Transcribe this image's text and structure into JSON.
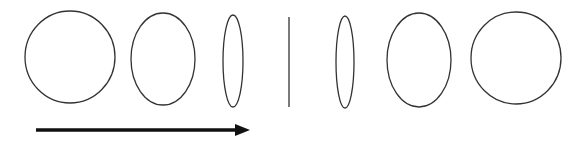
{
  "diagram": {
    "colors": {
      "stroke": "#333333",
      "arrow": "#111111",
      "background": "#ffffff"
    },
    "shapes": [
      {
        "id": "circle-left",
        "cx": 70,
        "cy": 57,
        "rx": 45,
        "ry": 46
      },
      {
        "id": "ellipse-left-medium",
        "cx": 163,
        "cy": 59,
        "rx": 32,
        "ry": 46
      },
      {
        "id": "ellipse-left-narrow",
        "cx": 233,
        "cy": 61,
        "rx": 10,
        "ry": 46
      },
      {
        "id": "line-center",
        "x": 289,
        "y1": 17,
        "y2": 107
      },
      {
        "id": "ellipse-right-narrow",
        "cx": 345,
        "cy": 62,
        "rx": 9,
        "ry": 46
      },
      {
        "id": "ellipse-right-medium",
        "cx": 419,
        "cy": 60,
        "rx": 32,
        "ry": 47
      },
      {
        "id": "circle-right",
        "cx": 516,
        "cy": 58,
        "rx": 45,
        "ry": 46
      }
    ],
    "arrow": {
      "x1": 36,
      "x2": 250,
      "y": 130,
      "direction": "right"
    }
  }
}
